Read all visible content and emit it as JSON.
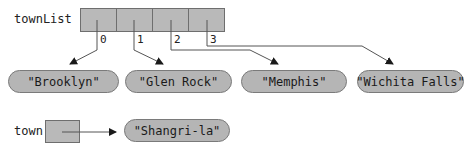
{
  "array": {
    "name": "townList",
    "indices": [
      "0",
      "1",
      "2",
      "3"
    ]
  },
  "strings": [
    {
      "text": "\"Brooklyn\""
    },
    {
      "text": "\"Glen Rock\""
    },
    {
      "text": "\"Memphis\""
    },
    {
      "text": "\"Wichita Falls\""
    }
  ],
  "reference": {
    "name": "town",
    "target": "\"Shangri-la\""
  },
  "colors": {
    "cell_fill": "#b9b9b9",
    "pill_fill": "#b5b5b5",
    "line": "#555555"
  }
}
